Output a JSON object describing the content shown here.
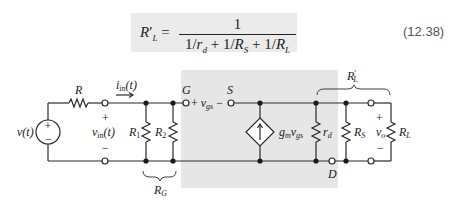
{
  "equation": {
    "lhs": "R′L =",
    "lhs_main": "R",
    "lhs_prime": "′",
    "lhs_sub": "L",
    "equals": "=",
    "numerator": "1",
    "denominator": "1/rd + 1/RS + 1/RL",
    "number": "(12.38)"
  },
  "circuit": {
    "source": {
      "label": "v(t)",
      "plus": "+",
      "minus": "−"
    },
    "series_resistor": {
      "label": "R"
    },
    "input_current": {
      "label": "i",
      "sub": "in",
      "suffix": "(t)"
    },
    "input_voltage": {
      "label": "v",
      "sub": "in",
      "suffix": "(t)",
      "plus": "+",
      "minus": "−"
    },
    "r1": {
      "label": "R",
      "sub": "1"
    },
    "r2": {
      "label": "R",
      "sub": "2"
    },
    "rg": {
      "label": "R",
      "sub": "G"
    },
    "gate": {
      "label": "G"
    },
    "source_terminal": {
      "label": "S"
    },
    "vgs": {
      "plus": "+",
      "label": "v",
      "sub": "gs",
      "minus": "−"
    },
    "dependent_source": {
      "label": "g",
      "sub": "m",
      "label2": "v",
      "sub2": "gs"
    },
    "rd": {
      "label": "r",
      "sub": "d"
    },
    "drain": {
      "label": "D"
    },
    "rs": {
      "label": "R",
      "sub": "S"
    },
    "vo": {
      "label": "v",
      "sub": "o",
      "plus": "+",
      "minus": "−"
    },
    "rl": {
      "label": "R",
      "sub": "L"
    },
    "rl_prime": {
      "label": "R",
      "prime": "′",
      "sub": "L"
    }
  },
  "colors": {
    "wire": "#2a2a2a",
    "shade": "#e6e6e6",
    "eq_box": "#ebebeb",
    "text": "#222222"
  }
}
